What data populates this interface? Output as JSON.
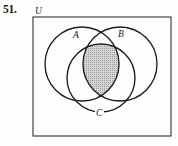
{
  "exercise": {
    "number_label": "51.",
    "universe_label": "U"
  },
  "diagram": {
    "type": "venn-3-set",
    "set_labels": {
      "a": "A",
      "b": "B",
      "c": "C"
    },
    "shaded_region": "A-intersect-B-intersect-C",
    "colors": {
      "ink": "#1c1c1c",
      "border": "#333333",
      "shade_fill": "#c9c9c9",
      "page_background": "#fdfdfb"
    },
    "universe_rect": {
      "x": 33,
      "y": 17,
      "width": 138,
      "height": 119
    },
    "circles": [
      {
        "name": "A",
        "cx": 82,
        "cy": 64,
        "r": 37
      },
      {
        "name": "B",
        "cx": 120,
        "cy": 64,
        "r": 37
      },
      {
        "name": "C",
        "cx": 101,
        "cy": 78,
        "r": 34
      }
    ],
    "label_positions": {
      "a": {
        "x": 73,
        "y": 37
      },
      "b": {
        "x": 121,
        "y": 36
      },
      "c": {
        "x": 99,
        "y": 115
      },
      "u": {
        "x": 36,
        "y": 14
      }
    }
  }
}
